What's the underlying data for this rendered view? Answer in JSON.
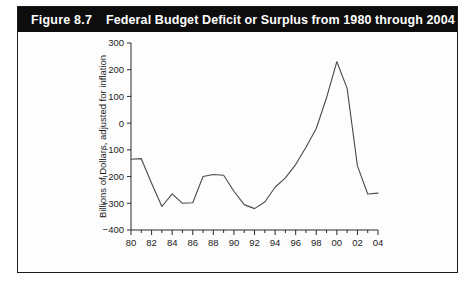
{
  "figure": {
    "number_label": "Figure 8.7",
    "title": "Federal Budget Deficit or Surplus from 1980 through 2004",
    "title_bar_color": "#0d0d0d",
    "title_text_color": "#ffffff",
    "border_color": "#1b1b1b",
    "background_color": "#fdfdfd"
  },
  "chart_data": {
    "type": "line",
    "title": "Federal Budget Deficit or Surplus from 1980 through 2004",
    "xlabel": "",
    "ylabel": "Billions of Dollars, adjusted for inflation",
    "xlim": [
      1980,
      2004
    ],
    "ylim": [
      -400,
      300
    ],
    "grid": false,
    "legend": false,
    "line_color": "#4a4a4a",
    "y_ticks": [
      300,
      200,
      100,
      0,
      -100,
      -200,
      -300,
      -400
    ],
    "y_tick_labels": [
      "300",
      "200",
      "100",
      "0",
      "-100",
      "-200",
      "-300",
      "-400"
    ],
    "x_ticks": [
      1980,
      1982,
      1984,
      1986,
      1988,
      1990,
      1992,
      1994,
      1996,
      1998,
      2000,
      2002,
      2004
    ],
    "x_tick_labels": [
      "80",
      "82",
      "84",
      "86",
      "88",
      "90",
      "92",
      "94",
      "96",
      "98",
      "00",
      "02",
      "04"
    ],
    "x_minor_tick_interval": 1,
    "x": [
      1980,
      1981,
      1982,
      1983,
      1984,
      1985,
      1986,
      1987,
      1988,
      1989,
      1990,
      1991,
      1992,
      1993,
      1994,
      1995,
      1996,
      1997,
      1998,
      1999,
      2000,
      2001,
      2002,
      2003,
      2004
    ],
    "values": [
      -135,
      -133,
      -225,
      -312,
      -265,
      -300,
      -298,
      -200,
      -192,
      -195,
      -255,
      -305,
      -320,
      -295,
      -240,
      -205,
      -155,
      -90,
      -20,
      95,
      230,
      130,
      -160,
      -265,
      -262
    ],
    "series": [
      {
        "name": "Federal budget deficit or surplus",
        "values": [
          -135,
          -133,
          -225,
          -312,
          -265,
          -300,
          -298,
          -200,
          -192,
          -195,
          -255,
          -305,
          -320,
          -295,
          -240,
          -205,
          -155,
          -90,
          -20,
          95,
          230,
          130,
          -160,
          -265,
          -262
        ]
      }
    ]
  }
}
